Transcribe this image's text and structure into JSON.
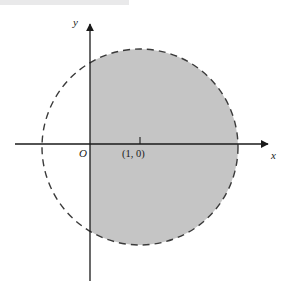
{
  "figure": {
    "kind": "cartesian-plane-diagram",
    "background_color": "#ffffff",
    "top_bar": {
      "color": "#e9e9ea",
      "width": 129,
      "height": 5
    },
    "axes": {
      "x_axis": {
        "label": "x",
        "y_position": 144,
        "x_start": 15,
        "x_end": 272,
        "color": "#1a1a1a",
        "arrowhead": "right"
      },
      "y_axis": {
        "label": "y",
        "x_position": 90,
        "y_start": 20,
        "y_end": 281,
        "color": "#1a1a1a",
        "arrowhead": "up"
      },
      "origin_label": "O"
    },
    "ticks": [
      {
        "label": "(1, 0)",
        "x_pixel": 140,
        "axis": "x",
        "value": 1
      }
    ],
    "circle": {
      "center_pixel": [
        140,
        147
      ],
      "radius_pixel": 98,
      "center_value": [
        1,
        0
      ],
      "radius_value": 1,
      "stroke_color": "#3a3a3a",
      "stroke_style": "dashed",
      "stroke_width": 1.4,
      "dash_pattern": "7 5"
    },
    "shaded_region": {
      "fill_color": "#c5c5c5",
      "condition": "x >= 0",
      "clip_left_pixel": 90
    }
  }
}
